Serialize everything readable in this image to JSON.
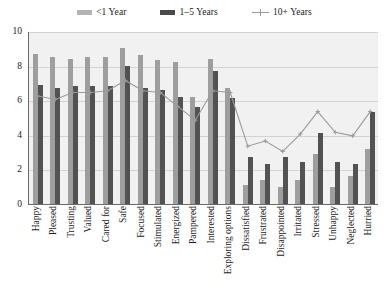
{
  "chart_data": {
    "type": "bar",
    "title": "",
    "subtitle": "",
    "xlabel": "",
    "ylabel": "",
    "ylim": [
      0,
      10
    ],
    "yticks": [
      0,
      2,
      4,
      6,
      8,
      10
    ],
    "grid": true,
    "legend_position": "top-center",
    "categories": [
      "Happy",
      "Pleased",
      "Trusting",
      "Valued",
      "Cared for",
      "Safe",
      "Focused",
      "Stimulated",
      "Energized",
      "Pampered",
      "Interested",
      "Exploring options",
      "Dissatisfied",
      "Frustrated",
      "Disappointed",
      "Irritated",
      "Stressed",
      "Unhappy",
      "Neglected",
      "Hurried"
    ],
    "series": [
      {
        "name": "<1 Year",
        "type": "bar",
        "color": "#9e9e9e",
        "values": [
          8.7,
          8.5,
          8.4,
          8.5,
          8.5,
          9.0,
          8.6,
          8.3,
          8.2,
          6.2,
          8.4,
          6.7,
          1.1,
          1.4,
          1.0,
          1.4,
          2.9,
          1.0,
          1.6,
          3.2
        ]
      },
      {
        "name": "1–5 Years",
        "type": "bar",
        "color": "#525252",
        "values": [
          6.9,
          6.7,
          6.8,
          6.8,
          6.8,
          8.0,
          6.7,
          6.6,
          6.2,
          5.6,
          7.7,
          6.1,
          2.7,
          2.3,
          2.7,
          2.4,
          4.1,
          2.4,
          2.3,
          5.3
        ]
      },
      {
        "name": "10+ Years",
        "type": "line",
        "color": "#9a9a9a",
        "values": [
          6.3,
          6.1,
          6.5,
          6.5,
          6.6,
          7.2,
          6.6,
          6.5,
          5.7,
          4.9,
          6.6,
          6.5,
          3.4,
          3.7,
          3.1,
          4.1,
          5.4,
          4.2,
          4.0,
          5.4
        ]
      }
    ]
  },
  "legend": {
    "items": [
      {
        "label": "<1 Year",
        "marker": "bar-swatch-light"
      },
      {
        "label": "1–5 Years",
        "marker": "bar-swatch-dark"
      },
      {
        "label": "10+ Years",
        "marker": "line-marker"
      }
    ]
  },
  "axes": {
    "y_tick_labels": [
      "10",
      "8",
      "6",
      "4",
      "2",
      "0"
    ]
  }
}
